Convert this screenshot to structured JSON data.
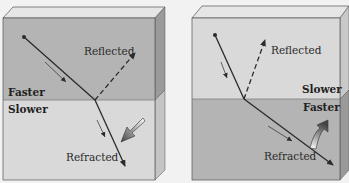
{
  "panels": [
    {
      "id": "left",
      "top_medium": "Faster",
      "bottom_medium": "Slower",
      "reflected_label": "Reflected",
      "refracted_label": "Refracted",
      "bend": "toward-normal"
    },
    {
      "id": "right",
      "top_medium": "Slower",
      "bottom_medium": "Faster",
      "reflected_label": "Reflected",
      "refracted_label": "Refracted",
      "bend": "away-from-normal"
    }
  ],
  "colors": {
    "faster_medium": "#b4b4b4",
    "slower_medium": "#d9d9d9",
    "ray": "#2b2b2b",
    "background": "#f2f2f2"
  }
}
